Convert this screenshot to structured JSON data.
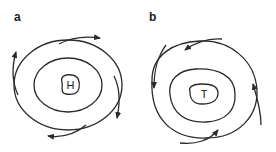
{
  "figure": {
    "panels": [
      {
        "id": "a",
        "label": "a",
        "center_label": "H",
        "meaning": "high pressure",
        "rotation": "clockwise",
        "flow": "outward",
        "isobars": 3,
        "arrows": 4
      },
      {
        "id": "b",
        "label": "b",
        "center_label": "T",
        "meaning": "low pressure",
        "rotation": "counter-clockwise",
        "flow": "inward",
        "isobars": 3,
        "arrows": 4
      }
    ],
    "colors": {
      "stroke": "#2a2a2a",
      "background": "#ffffff"
    }
  }
}
